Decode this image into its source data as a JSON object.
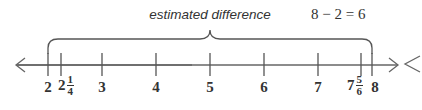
{
  "caption": "estimated difference",
  "equation": "8 − 2 = 6",
  "number_line": {
    "arrows": "both",
    "extra_glyph_right": "<",
    "ticks": [
      {
        "label": "2",
        "value": 2,
        "x": 48
      },
      {
        "whole": "2",
        "num": "1",
        "den": "4",
        "value": 2.25,
        "x": 61
      },
      {
        "label": "3",
        "value": 3,
        "x": 102
      },
      {
        "label": "4",
        "value": 4,
        "x": 156
      },
      {
        "label": "5",
        "value": 5,
        "x": 210
      },
      {
        "label": "6",
        "value": 6,
        "x": 264
      },
      {
        "label": "7",
        "value": 7,
        "x": 318
      },
      {
        "whole": "7",
        "num": "5",
        "den": "6",
        "value": 7.8333,
        "x": 361
      },
      {
        "label": "8",
        "value": 8,
        "x": 372
      }
    ],
    "brace": {
      "from": 2,
      "to": 8
    }
  },
  "colors": {
    "stroke": "#555555",
    "text": "#333333"
  }
}
